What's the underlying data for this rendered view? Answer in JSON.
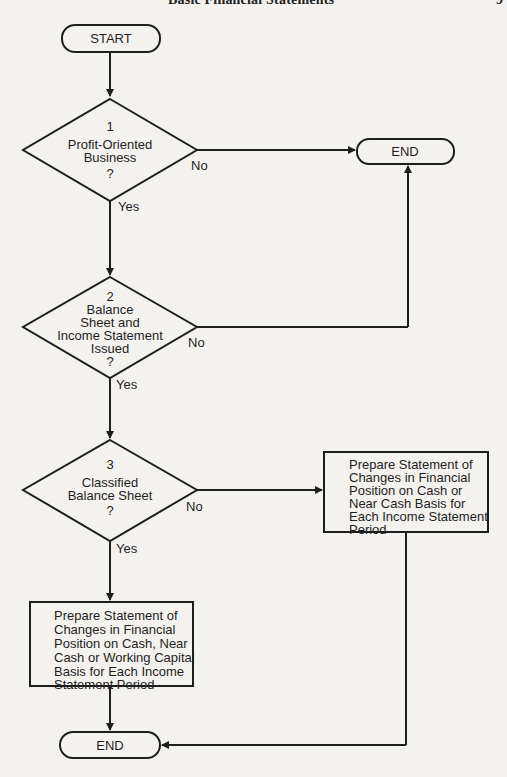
{
  "header": {
    "running_title": "Basic Financial Statements",
    "page_number": "9"
  },
  "nodes": {
    "start": {
      "label": "START"
    },
    "end_top": {
      "label": "END"
    },
    "end_bottom": {
      "label": "END"
    },
    "decision1": {
      "number": "1",
      "lines": [
        "Profit-Oriented",
        "Business",
        "?"
      ]
    },
    "decision2": {
      "number": "2",
      "lines": [
        "Balance",
        "Sheet and",
        "Income Statement",
        "Issued",
        "?"
      ]
    },
    "decision3": {
      "number": "3",
      "lines": [
        "Classified",
        "Balance Sheet",
        "?"
      ]
    },
    "process_right": {
      "lines": [
        "Prepare Statement of",
        "Changes in Financial",
        "Position on Cash or",
        "Near Cash Basis for",
        "Each Income Statement",
        "Period"
      ]
    },
    "process_left": {
      "lines": [
        "Prepare Statement of",
        "Changes in Financial",
        "Position on Cash, Near",
        "Cash or Working Capital",
        "Basis for Each Income",
        "Statement Period"
      ]
    }
  },
  "edge_labels": {
    "d1_no": "No",
    "d1_yes": "Yes",
    "d2_no": "No",
    "d2_yes": "Yes",
    "d3_no": "No",
    "d3_yes": "Yes"
  }
}
